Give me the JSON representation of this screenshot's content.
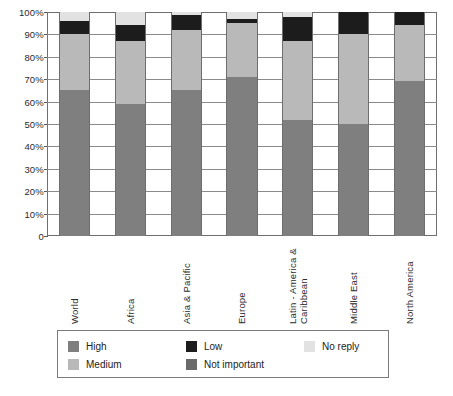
{
  "chart_data": {
    "type": "bar",
    "subtype": "stacked-100-percent",
    "title": "",
    "xlabel": "",
    "ylabel": "",
    "ylim": [
      0,
      100
    ],
    "ytick_labels": [
      "100%",
      "90%",
      "80%",
      "70%",
      "60%",
      "50%",
      "40%",
      "30%",
      "20%",
      "10%",
      "0"
    ],
    "ytick_values": [
      100,
      90,
      80,
      70,
      60,
      50,
      40,
      30,
      20,
      10,
      0
    ],
    "grid": true,
    "legend_position": "bottom",
    "categories": [
      "World",
      "Africa",
      "Asia & Pacific",
      "Europe",
      "Latin - America &\nCaribbean",
      "Middle East",
      "North America"
    ],
    "series": [
      {
        "name": "High",
        "color": "#7f7f7f",
        "values": [
          65,
          59,
          65,
          71,
          52,
          50,
          69
        ]
      },
      {
        "name": "Medium",
        "color": "#b9b9b9",
        "values": [
          25,
          28,
          27,
          24,
          35,
          40,
          25
        ]
      },
      {
        "name": "Low",
        "color": "#1c1c1c",
        "values": [
          6,
          7,
          6.5,
          2,
          11,
          10,
          6
        ]
      },
      {
        "name": "Not important",
        "color": "#6a6a6a",
        "values": [
          0,
          0,
          0,
          0,
          0,
          0,
          0
        ]
      },
      {
        "name": "No reply",
        "color": "#e2e2e2",
        "values": [
          4,
          6,
          1.5,
          3,
          2,
          0,
          0
        ]
      }
    ]
  },
  "legend": {
    "entries": [
      {
        "label": "High",
        "swatch": "sw-high"
      },
      {
        "label": "Low",
        "swatch": "sw-low"
      },
      {
        "label": "No reply",
        "swatch": "sw-noreply"
      },
      {
        "label": "Medium",
        "swatch": "sw-medium"
      },
      {
        "label": "Not important",
        "swatch": "sw-notimp"
      }
    ]
  }
}
